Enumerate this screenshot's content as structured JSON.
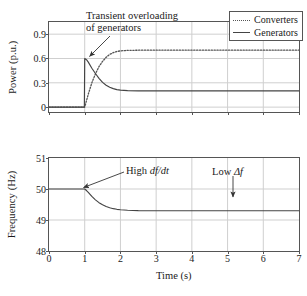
{
  "figure": {
    "background": "#ffffff",
    "line_color": "#444444",
    "grid_color": "#cfcfcf",
    "frame_color": "#555555"
  },
  "xaxis": {
    "label": "Time (s)",
    "ticks": [
      "0",
      "1",
      "2",
      "3",
      "4",
      "5",
      "6",
      "7"
    ],
    "min": 0,
    "max": 7
  },
  "chart_data": [
    {
      "type": "line",
      "panel": "top",
      "title": "",
      "xlabel": "",
      "ylabel": "Power (p.u.)",
      "xlim": [
        0,
        7
      ],
      "ylim": [
        -0.06,
        1.05
      ],
      "yticks": [
        "0",
        "0.3",
        "0.6",
        "0.9"
      ],
      "ytick_values": [
        0,
        0.3,
        0.6,
        0.9
      ],
      "grid": true,
      "legend_position": "top-right",
      "series": [
        {
          "name": "Converters",
          "style": "dotted",
          "color": "#555555",
          "x": [
            0,
            0.2,
            0.4,
            0.6,
            0.8,
            1.0,
            1.05,
            1.1,
            1.2,
            1.3,
            1.4,
            1.5,
            1.6,
            1.7,
            1.8,
            1.9,
            2.0,
            2.2,
            2.5,
            3.0,
            4.0,
            5.0,
            6.0,
            7.0
          ],
          "y": [
            0,
            0,
            0,
            0,
            0,
            0,
            0.08,
            0.16,
            0.3,
            0.41,
            0.5,
            0.565,
            0.615,
            0.65,
            0.672,
            0.686,
            0.694,
            0.7,
            0.702,
            0.703,
            0.703,
            0.703,
            0.703,
            0.703
          ]
        },
        {
          "name": "Generators",
          "style": "solid",
          "color": "#444444",
          "x": [
            0,
            0.2,
            0.4,
            0.6,
            0.8,
            0.99,
            1.0,
            1.05,
            1.1,
            1.2,
            1.3,
            1.4,
            1.5,
            1.6,
            1.7,
            1.8,
            1.9,
            2.0,
            2.2,
            2.5,
            3.0,
            4.0,
            5.0,
            6.0,
            7.0
          ],
          "y": [
            0,
            0,
            0,
            0,
            0,
            0,
            0.6,
            0.585,
            0.555,
            0.48,
            0.415,
            0.355,
            0.305,
            0.27,
            0.245,
            0.228,
            0.216,
            0.21,
            0.204,
            0.201,
            0.2,
            0.2,
            0.2,
            0.2,
            0.2
          ]
        }
      ],
      "annotations": [
        {
          "id": "transient-overloading",
          "text_lines": [
            "Transient overloading",
            "of generators"
          ],
          "arrow": true,
          "points_to_x": 1.05,
          "points_to_y": 0.58
        }
      ]
    },
    {
      "type": "line",
      "panel": "bottom",
      "title": "",
      "xlabel": "Time (s)",
      "ylabel": "Frequency (Hz)",
      "xlim": [
        0,
        7
      ],
      "ylim": [
        48,
        51
      ],
      "yticks": [
        "48",
        "49",
        "50",
        "51"
      ],
      "ytick_values": [
        48,
        49,
        50,
        51
      ],
      "grid": true,
      "series": [
        {
          "name": "Frequency",
          "style": "solid",
          "color": "#444444",
          "x": [
            0,
            0.25,
            0.5,
            0.75,
            1.0,
            1.05,
            1.1,
            1.2,
            1.3,
            1.4,
            1.5,
            1.6,
            1.7,
            1.8,
            1.9,
            2.0,
            2.2,
            2.5,
            3.0,
            3.5,
            4.0,
            5.0,
            6.0,
            7.0
          ],
          "y": [
            50,
            50,
            50,
            50,
            50,
            49.95,
            49.89,
            49.76,
            49.65,
            49.56,
            49.49,
            49.435,
            49.395,
            49.365,
            49.345,
            49.33,
            49.313,
            49.303,
            49.3,
            49.3,
            49.3,
            49.3,
            49.3,
            49.3
          ]
        }
      ],
      "annotations": [
        {
          "id": "high-dfdt",
          "text_prefix": "High ",
          "text_italic": "df/dt",
          "arrow": true,
          "points_to_x": 1.03,
          "points_to_y": 49.93
        },
        {
          "id": "low-delta-f",
          "text_prefix": "Low ",
          "text_italic": "Δf",
          "arrow": true,
          "points_to_x": 5.4,
          "points_to_y": 49.45
        }
      ]
    }
  ],
  "legend": {
    "items": [
      {
        "label": "Converters",
        "style": "dotted"
      },
      {
        "label": "Generators",
        "style": "solid"
      }
    ]
  }
}
